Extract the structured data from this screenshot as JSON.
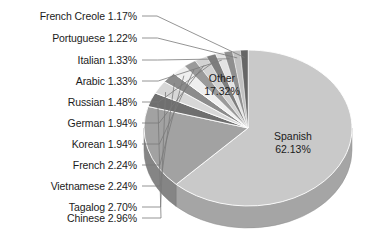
{
  "chart_data": {
    "type": "pie",
    "title": "",
    "subtitle": "",
    "xlabel": "",
    "ylabel": "",
    "legend_position": "none",
    "grid": false,
    "units": "percent",
    "start_angle_deg": 0,
    "direction": "clockwise",
    "categories": [
      "Spanish",
      "Other",
      "Chinese",
      "Tagalog",
      "Vietnamese",
      "French",
      "Korean",
      "German",
      "Russian",
      "Arabic",
      "Italian",
      "Portuguese",
      "French Creole"
    ],
    "values": [
      62.13,
      17.32,
      2.96,
      2.7,
      2.24,
      2.24,
      1.94,
      1.94,
      1.48,
      1.33,
      1.33,
      1.22,
      1.17
    ],
    "slices": [
      {
        "label": "Spanish",
        "value": 62.13,
        "value_text": "62.13%",
        "color": "#c9c9c9",
        "label_type": "inside"
      },
      {
        "label": "Other",
        "value": 17.32,
        "value_text": "17.32%",
        "color": "#a2a2a2",
        "label_type": "inside"
      },
      {
        "label": "Chinese",
        "value": 2.96,
        "value_text": "2.96%",
        "color": "#6f6f6f",
        "label_type": "callout"
      },
      {
        "label": "Tagalog",
        "value": 2.7,
        "value_text": "2.70%",
        "color": "#d7d7d7",
        "label_type": "callout"
      },
      {
        "label": "Vietnamese",
        "value": 2.24,
        "value_text": "2.24%",
        "color": "#8c8c8c",
        "label_type": "callout"
      },
      {
        "label": "French",
        "value": 2.24,
        "value_text": "2.24%",
        "color": "#efefef",
        "label_type": "callout"
      },
      {
        "label": "Korean",
        "value": 1.94,
        "value_text": "1.94%",
        "color": "#9a9a9a",
        "label_type": "callout"
      },
      {
        "label": "German",
        "value": 1.94,
        "value_text": "1.94%",
        "color": "#d2d2d2",
        "label_type": "callout"
      },
      {
        "label": "Russian",
        "value": 1.48,
        "value_text": "1.48%",
        "color": "#7d7d7d",
        "label_type": "callout"
      },
      {
        "label": "Arabic",
        "value": 1.33,
        "value_text": "1.33%",
        "color": "#e3e3e3",
        "label_type": "callout"
      },
      {
        "label": "Italian",
        "value": 1.33,
        "value_text": "1.33%",
        "color": "#8f8f8f",
        "label_type": "callout"
      },
      {
        "label": "Portuguese",
        "value": 1.22,
        "value_text": "1.22%",
        "color": "#c2c2c2",
        "label_type": "callout"
      },
      {
        "label": "French Creole",
        "value": 1.17,
        "value_text": "1.17%",
        "color": "#666666",
        "label_type": "callout"
      }
    ]
  },
  "inside_labels": [
    {
      "name": "other",
      "label": "Other",
      "value_text": "17.32%"
    },
    {
      "name": "spanish",
      "label": "Spanish",
      "value_text": "62.13%"
    }
  ],
  "callout_labels": [
    {
      "name": "french-creole",
      "text": "French Creole 1.17%"
    },
    {
      "name": "portuguese",
      "text": "Portuguese 1.22%"
    },
    {
      "name": "italian",
      "text": "Italian 1.33%"
    },
    {
      "name": "arabic",
      "text": "Arabic 1.33%"
    },
    {
      "name": "russian",
      "text": "Russian 1.48%"
    },
    {
      "name": "german",
      "text": "German 1.94%"
    },
    {
      "name": "korean",
      "text": "Korean 1.94%"
    },
    {
      "name": "french",
      "text": "French 2.24%"
    },
    {
      "name": "vietnamese",
      "text": "Vietnamese 2.24%"
    },
    {
      "name": "tagalog",
      "text": "Tagalog 2.70%"
    },
    {
      "name": "chinese",
      "text": "Chinese 2.96%"
    }
  ],
  "colors": {
    "background": "#ffffff",
    "text": "#1b1b1b",
    "leader_line": "#7a7a7a",
    "side_wall_shade": "#b0b0b0",
    "edge_stroke": "#ffffff"
  }
}
